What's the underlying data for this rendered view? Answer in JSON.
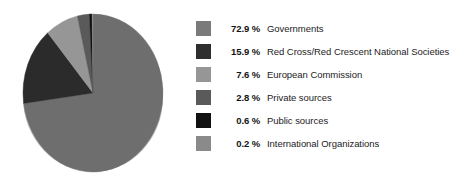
{
  "chart_data": {
    "type": "pie",
    "title": "",
    "subtitle": "",
    "xlabel": "",
    "ylabel": "",
    "legend_position": "right",
    "grid": false,
    "start_angle_deg": 0,
    "direction": "clockwise",
    "unit": "%",
    "categories": [
      "Governments",
      "Red Cross/Red Crescent National Societies",
      "European Commission",
      "Private sources",
      "Public sources",
      "International Organizations"
    ],
    "values": [
      72.9,
      15.9,
      7.6,
      2.8,
      0.6,
      0.2
    ],
    "colors": [
      "#6e6e6e",
      "#2b2b2b",
      "#969696",
      "#5a5a5a",
      "#111111",
      "#8a8a8a"
    ],
    "slices": [
      {
        "label": "Governments",
        "percent": 72.9,
        "percent_text": "72.9 %",
        "color": "#6e6e6e"
      },
      {
        "label": "Red Cross/Red Crescent National Societies",
        "percent": 15.9,
        "percent_text": "15.9 %",
        "color": "#2b2b2b"
      },
      {
        "label": "European Commission",
        "percent": 7.6,
        "percent_text": "7.6 %",
        "color": "#969696"
      },
      {
        "label": "Private sources",
        "percent": 2.8,
        "percent_text": "2.8 %",
        "color": "#5a5a5a"
      },
      {
        "label": "Public sources",
        "percent": 0.6,
        "percent_text": "0.6 %",
        "color": "#111111"
      },
      {
        "label": "International Organizations",
        "percent": 0.2,
        "percent_text": "0.2 %",
        "color": "#8a8a8a"
      }
    ]
  },
  "legend": {
    "items": [
      {
        "percent_text": "72.9 %",
        "label": "Governments",
        "color": "#7a7a7a"
      },
      {
        "percent_text": "15.9 %",
        "label": "Red Cross/Red Crescent National Societies",
        "color": "#2e2e2e"
      },
      {
        "percent_text": "7.6 %",
        "label": "European Commission",
        "color": "#969696"
      },
      {
        "percent_text": "2.8 %",
        "label": "Private sources",
        "color": "#5a5a5a"
      },
      {
        "percent_text": "0.6 %",
        "label": "Public sources",
        "color": "#111111"
      },
      {
        "percent_text": "0.2 %",
        "label": "International Organizations",
        "color": "#8a8a8a"
      }
    ]
  },
  "theme": {
    "background": "#ffffff",
    "text_color": "#1c1c1c",
    "pie_rim_color": "#c9c9c9"
  }
}
